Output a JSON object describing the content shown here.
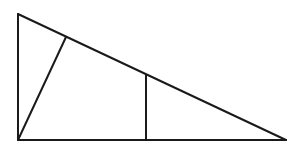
{
  "diagram": {
    "type": "geometry",
    "stroke_color": "#1a1a1a",
    "background_color": "#ffffff",
    "points": {
      "A": {
        "x": 18,
        "y": 14
      },
      "B": {
        "x": 18,
        "y": 140
      },
      "C": {
        "x": 286,
        "y": 140
      },
      "D": {
        "x": 66,
        "y": 37
      },
      "E": {
        "x": 146,
        "y": 75
      },
      "F": {
        "x": 146,
        "y": 140
      }
    },
    "segments": [
      {
        "name": "left-leg",
        "from": "A",
        "to": "B"
      },
      {
        "name": "base",
        "from": "B",
        "to": "C"
      },
      {
        "name": "hypotenuse",
        "from": "A",
        "to": "C"
      },
      {
        "name": "cevian",
        "from": "B",
        "to": "D"
      },
      {
        "name": "vertical-segment",
        "from": "E",
        "to": "F"
      }
    ]
  }
}
